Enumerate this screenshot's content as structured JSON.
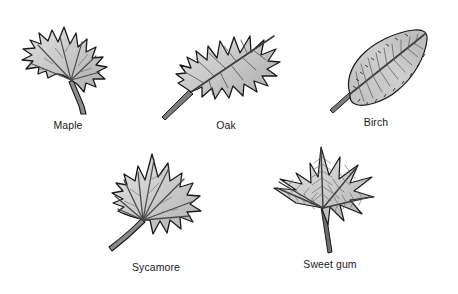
{
  "figure": {
    "background_color": "#ffffff",
    "cut_off_header_text": "",
    "style": {
      "leaf_fill": "#c8c8c8",
      "leaf_fill_light": "#d8d8d8",
      "leaf_fill_dark": "#b0b0b0",
      "outline_color": "#1a1a1a",
      "vein_color": "#3a3a3a",
      "stem_color": "#555555",
      "label_color": "#1a1a1a"
    },
    "leaves": [
      {
        "id": "maple",
        "label": "Maple",
        "leaf_type": "palmate-lobed",
        "lobes": 5,
        "margin": "toothed",
        "venation": "palmate",
        "orientation": "upright, stem lower-right"
      },
      {
        "id": "oak",
        "label": "Oak",
        "leaf_type": "pinnately-lobed",
        "lobes": 7,
        "margin": "deeply-lobed-bristle-tipped",
        "venation": "pinnate",
        "orientation": "diagonal, stem lower-left"
      },
      {
        "id": "birch",
        "label": "Birch",
        "leaf_type": "simple-ovate",
        "lobes": 0,
        "margin": "doubly-serrate",
        "venation": "pinnate-parallel",
        "orientation": "diagonal, stem lower-left"
      },
      {
        "id": "sycamore",
        "label": "Sycamore",
        "leaf_type": "palmate-broad",
        "lobes": 5,
        "margin": "coarsely-toothed",
        "venation": "palmate",
        "orientation": "upright, long curved stem lower-left"
      },
      {
        "id": "sweetgum",
        "label": "Sweet gum",
        "leaf_type": "star-shaped-palmate",
        "lobes": 5,
        "margin": "finely-serrate",
        "venation": "palmate-herringbone",
        "orientation": "upright, long straight stem below"
      }
    ]
  }
}
